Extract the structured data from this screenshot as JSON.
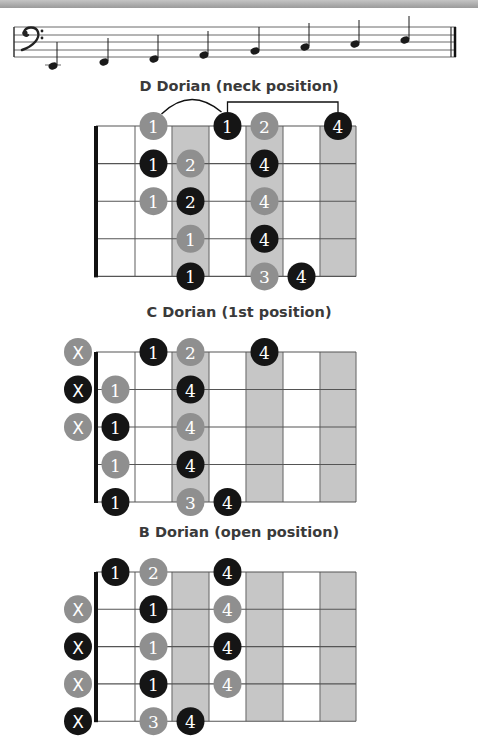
{
  "colors": {
    "black_dot": "#151515",
    "gray_dot": "#8f8f8f",
    "shaded_column": "#c6c6c6",
    "grid_line": "#555555",
    "nut": "#111111",
    "title": "#3a3a3a"
  },
  "staff": {
    "clef": "bass-clef",
    "notes": [
      {
        "x": 53,
        "y": 66,
        "ledger": true
      },
      {
        "x": 104,
        "y": 62
      },
      {
        "x": 154,
        "y": 59
      },
      {
        "x": 204,
        "y": 55
      },
      {
        "x": 255,
        "y": 51
      },
      {
        "x": 305,
        "y": 47
      },
      {
        "x": 355,
        "y": 44
      },
      {
        "x": 405,
        "y": 40
      }
    ]
  },
  "diagrams": [
    {
      "title": "D Dorian (neck position)",
      "shaded_frets": [
        3,
        5,
        7
      ],
      "dots": [
        {
          "string": 1,
          "fret": 2,
          "label": "1",
          "color": "gray"
        },
        {
          "string": 1,
          "fret": 4,
          "label": "1",
          "color": "black"
        },
        {
          "string": 1,
          "fret": 5,
          "label": "2",
          "color": "gray"
        },
        {
          "string": 1,
          "fret": 7,
          "label": "4",
          "color": "black"
        },
        {
          "string": 2,
          "fret": 2,
          "label": "1",
          "color": "black"
        },
        {
          "string": 2,
          "fret": 3,
          "label": "2",
          "color": "gray"
        },
        {
          "string": 2,
          "fret": 5,
          "label": "4",
          "color": "black"
        },
        {
          "string": 3,
          "fret": 2,
          "label": "1",
          "color": "gray"
        },
        {
          "string": 3,
          "fret": 3,
          "label": "2",
          "color": "black"
        },
        {
          "string": 3,
          "fret": 5,
          "label": "4",
          "color": "gray"
        },
        {
          "string": 4,
          "fret": 3,
          "label": "1",
          "color": "gray"
        },
        {
          "string": 4,
          "fret": 5,
          "label": "4",
          "color": "black"
        },
        {
          "string": 5,
          "fret": 3,
          "label": "1",
          "color": "black"
        },
        {
          "string": 5,
          "fret": 5,
          "label": "3",
          "color": "gray"
        },
        {
          "string": 5,
          "fret": 6,
          "label": "4",
          "color": "black"
        }
      ],
      "muted": []
    },
    {
      "title": "C Dorian (1st position)",
      "shaded_frets": [
        3,
        5,
        7
      ],
      "dots": [
        {
          "string": 1,
          "fret": 2,
          "label": "1",
          "color": "black"
        },
        {
          "string": 1,
          "fret": 3,
          "label": "2",
          "color": "gray"
        },
        {
          "string": 1,
          "fret": 5,
          "label": "4",
          "color": "black"
        },
        {
          "string": 2,
          "fret": 1,
          "label": "1",
          "color": "gray"
        },
        {
          "string": 2,
          "fret": 3,
          "label": "4",
          "color": "black"
        },
        {
          "string": 3,
          "fret": 1,
          "label": "1",
          "color": "black"
        },
        {
          "string": 3,
          "fret": 3,
          "label": "4",
          "color": "gray"
        },
        {
          "string": 4,
          "fret": 1,
          "label": "1",
          "color": "gray"
        },
        {
          "string": 4,
          "fret": 3,
          "label": "4",
          "color": "black"
        },
        {
          "string": 5,
          "fret": 1,
          "label": "1",
          "color": "black"
        },
        {
          "string": 5,
          "fret": 3,
          "label": "3",
          "color": "gray"
        },
        {
          "string": 5,
          "fret": 4,
          "label": "4",
          "color": "black"
        }
      ],
      "muted": [
        {
          "string": 1,
          "label": "X",
          "color": "gray"
        },
        {
          "string": 2,
          "label": "X",
          "color": "black"
        },
        {
          "string": 3,
          "label": "X",
          "color": "gray"
        }
      ]
    },
    {
      "title": "B Dorian (open position)",
      "shaded_frets": [
        3,
        5,
        7
      ],
      "dots": [
        {
          "string": 1,
          "fret": 1,
          "label": "1",
          "color": "black"
        },
        {
          "string": 1,
          "fret": 2,
          "label": "2",
          "color": "gray"
        },
        {
          "string": 1,
          "fret": 4,
          "label": "4",
          "color": "black"
        },
        {
          "string": 2,
          "fret": 2,
          "label": "1",
          "color": "black"
        },
        {
          "string": 2,
          "fret": 4,
          "label": "4",
          "color": "gray"
        },
        {
          "string": 3,
          "fret": 2,
          "label": "1",
          "color": "gray"
        },
        {
          "string": 3,
          "fret": 4,
          "label": "4",
          "color": "black"
        },
        {
          "string": 4,
          "fret": 2,
          "label": "1",
          "color": "black"
        },
        {
          "string": 4,
          "fret": 4,
          "label": "4",
          "color": "gray"
        },
        {
          "string": 5,
          "fret": 2,
          "label": "3",
          "color": "gray"
        },
        {
          "string": 5,
          "fret": 3,
          "label": "4",
          "color": "black"
        }
      ],
      "muted": [
        {
          "string": 2,
          "label": "X",
          "color": "gray"
        },
        {
          "string": 3,
          "label": "X",
          "color": "black"
        },
        {
          "string": 4,
          "label": "X",
          "color": "gray"
        },
        {
          "string": 5,
          "label": "X",
          "color": "black"
        }
      ]
    }
  ]
}
